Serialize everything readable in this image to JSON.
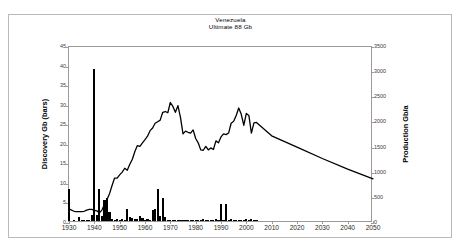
{
  "figure": {
    "title_lines": [
      "Venezuela",
      "Ultimate  88 Gb"
    ],
    "background_color": "#ffffff",
    "border_color": "#b9b9b9",
    "axis_color": "#9a9a9a",
    "data_color": "#000000"
  },
  "axes": {
    "x": {
      "label": "",
      "ticks": [
        1930,
        1940,
        1950,
        1960,
        1970,
        1980,
        1990,
        2000,
        2010,
        2020,
        2030,
        2040,
        2050
      ],
      "min": 1930,
      "max": 2050
    },
    "y_left": {
      "label": "Discovery Gb (bars)",
      "ticks": [
        0,
        5,
        10,
        15,
        20,
        25,
        30,
        35,
        40,
        45
      ],
      "min": 0,
      "max": 45
    },
    "y_right": {
      "label": "Production Gb/a",
      "ticks": [
        0,
        500,
        1000,
        1500,
        2000,
        2500,
        3000,
        3500
      ],
      "min": 0,
      "max": 3500
    }
  },
  "chart_data": {
    "type": "bar",
    "subtitle": "Ultimate  88 Gb",
    "xlabel": "",
    "ylabel": "Discovery Gb (bars)",
    "y2label": "Production Gb/a",
    "xlim": [
      1930,
      2050
    ],
    "ylim": [
      0,
      45
    ],
    "y2lim": [
      0,
      3500
    ],
    "grid": false,
    "legend": "none",
    "series": [
      {
        "name": "Discovery Gb (bars)",
        "type": "bar",
        "axis": "left",
        "x": [
          1930,
          1931,
          1932,
          1933,
          1934,
          1935,
          1936,
          1937,
          1938,
          1939,
          1940,
          1941,
          1942,
          1943,
          1944,
          1945,
          1946,
          1947,
          1948,
          1949,
          1950,
          1951,
          1952,
          1953,
          1954,
          1955,
          1956,
          1957,
          1958,
          1959,
          1960,
          1961,
          1962,
          1963,
          1964,
          1965,
          1966,
          1967,
          1968,
          1969,
          1970,
          1971,
          1972,
          1973,
          1974,
          1975,
          1976,
          1977,
          1978,
          1979,
          1980,
          1981,
          1982,
          1983,
          1984,
          1985,
          1986,
          1987,
          1988,
          1989,
          1990,
          1991,
          1992,
          1993,
          1994,
          1995,
          1996,
          1997,
          1998,
          1999,
          2000,
          2001,
          2002,
          2003,
          2004
        ],
        "values": [
          8.3,
          0.0,
          0.3,
          0.0,
          1.0,
          0.2,
          0.1,
          0.2,
          0.2,
          1.6,
          38.8,
          1.5,
          8.1,
          1.4,
          5.3,
          6.0,
          2.2,
          0.4,
          0.3,
          0.6,
          0.3,
          0.4,
          0.2,
          3.1,
          1.1,
          0.7,
          0.6,
          0.5,
          1.2,
          0.8,
          0.2,
          0.5,
          0.3,
          2.9,
          3.0,
          8.3,
          1.4,
          5.8,
          1.0,
          0.2,
          0.1,
          0.2,
          0.1,
          0.2,
          0.1,
          0.1,
          0.1,
          0.2,
          0.1,
          0.1,
          0.3,
          0.2,
          0.3,
          0.4,
          0.2,
          0.2,
          0.1,
          0.2,
          0.4,
          0.2,
          4.3,
          0.3,
          4.3,
          0.3,
          0.6,
          0.1,
          0.2,
          0.2,
          0.1,
          0.1,
          0.6,
          0.3,
          0.5,
          0.2,
          0.2
        ]
      },
      {
        "name": "Production Gb/a",
        "type": "line",
        "axis": "right",
        "x": [
          1930,
          1931,
          1932,
          1933,
          1934,
          1935,
          1936,
          1937,
          1938,
          1939,
          1940,
          1941,
          1942,
          1943,
          1944,
          1945,
          1946,
          1947,
          1948,
          1949,
          1950,
          1951,
          1952,
          1953,
          1954,
          1955,
          1956,
          1957,
          1958,
          1959,
          1960,
          1961,
          1962,
          1963,
          1964,
          1965,
          1966,
          1967,
          1968,
          1969,
          1970,
          1971,
          1972,
          1973,
          1974,
          1975,
          1976,
          1977,
          1978,
          1979,
          1980,
          1981,
          1982,
          1983,
          1984,
          1985,
          1986,
          1987,
          1988,
          1989,
          1990,
          1991,
          1992,
          1993,
          1994,
          1995,
          1996,
          1997,
          1998,
          1999,
          2000,
          2001,
          2002,
          2003,
          2004,
          2010,
          2020,
          2030,
          2040,
          2050
        ],
        "values_left_scale": [
          3.6,
          3.3,
          3.0,
          2.9,
          2.9,
          2.9,
          3.0,
          3.3,
          3.5,
          3.5,
          3.2,
          3.1,
          2.6,
          3.3,
          4.7,
          6.0,
          7.5,
          9.6,
          11.5,
          11.5,
          12.3,
          13.0,
          14.0,
          13.5,
          15.0,
          16.3,
          18.3,
          19.8,
          19.6,
          20.5,
          21.3,
          22.2,
          23.6,
          24.3,
          25.5,
          25.9,
          26.3,
          28.3,
          28.5,
          28.2,
          30.8,
          29.8,
          28.3,
          30.0,
          27.0,
          22.8,
          23.5,
          23.2,
          23.0,
          23.8,
          21.6,
          20.5,
          18.7,
          18.6,
          19.6,
          18.7,
          19.2,
          18.8,
          21.0,
          20.5,
          22.0,
          22.8,
          22.6,
          23.0,
          25.5,
          26.0,
          27.5,
          29.4,
          27.8,
          25.0,
          28.0,
          27.5,
          23.0,
          25.6,
          25.7,
          22.3,
          19.4,
          16.5,
          13.8,
          11.3
        ],
        "values": [
          280,
          257,
          233,
          226,
          226,
          226,
          233,
          257,
          272,
          272,
          249,
          241,
          202,
          257,
          366,
          467,
          583,
          747,
          894,
          894,
          957,
          1011,
          1089,
          1050,
          1167,
          1268,
          1423,
          1540,
          1524,
          1594,
          1657,
          1727,
          1836,
          1890,
          1983,
          2014,
          2046,
          2201,
          2217,
          2193,
          2396,
          2318,
          2201,
          2333,
          2100,
          1773,
          1828,
          1804,
          1789,
          1851,
          1680,
          1594,
          1454,
          1447,
          1524,
          1454,
          1493,
          1462,
          1633,
          1594,
          1711,
          1773,
          1758,
          1789,
          1983,
          2022,
          2139,
          2287,
          2162,
          1944,
          2178,
          2139,
          1789,
          1991,
          1999,
          1734,
          1509,
          1283,
          1073,
          879
        ]
      }
    ]
  }
}
